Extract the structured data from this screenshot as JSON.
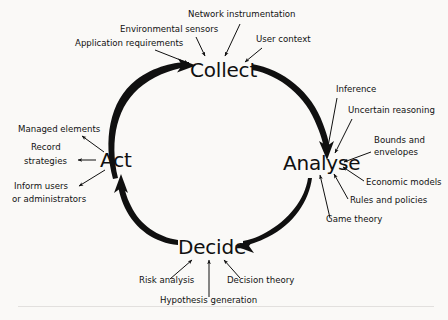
{
  "diagram": {
    "type": "cycle-diagram",
    "background_color": "#faf9f7",
    "ink_color": "#101010",
    "nodes": [
      {
        "id": "collect",
        "label": "Collect",
        "x": 220,
        "y": 70
      },
      {
        "id": "analyse",
        "label": "Analyse",
        "x": 318,
        "y": 163
      },
      {
        "id": "decide",
        "label": "Decide",
        "x": 209,
        "y": 247
      },
      {
        "id": "act",
        "label": "Act",
        "x": 119,
        "y": 160
      }
    ],
    "cycle_edges": [
      {
        "from": "act",
        "to": "collect"
      },
      {
        "from": "collect",
        "to": "analyse"
      },
      {
        "from": "analyse",
        "to": "decide"
      },
      {
        "from": "decide",
        "to": "act"
      }
    ],
    "annotations": {
      "collect_inputs": [
        {
          "label": "Application requirements",
          "x": 75,
          "y": 46,
          "anchor": "start"
        },
        {
          "label": "Environmental sensors",
          "x": 120,
          "y": 32,
          "anchor": "start"
        },
        {
          "label": "Network instrumentation",
          "x": 188,
          "y": 17,
          "anchor": "start"
        },
        {
          "label": "User context",
          "x": 256,
          "y": 42,
          "anchor": "start"
        }
      ],
      "analyse_inputs": [
        {
          "label": "Inference",
          "x": 336,
          "y": 92,
          "anchor": "start"
        },
        {
          "label": "Uncertain reasoning",
          "x": 348,
          "y": 113,
          "anchor": "start"
        },
        {
          "label": "Bounds and",
          "x": 374,
          "y": 143,
          "anchor": "start"
        },
        {
          "label": "envelopes",
          "x": 374,
          "y": 155,
          "anchor": "start"
        },
        {
          "label": "Economic models",
          "x": 366,
          "y": 185,
          "anchor": "start"
        },
        {
          "label": "Rules and policies",
          "x": 350,
          "y": 203,
          "anchor": "start"
        },
        {
          "label": "Game theory",
          "x": 326,
          "y": 222,
          "anchor": "start"
        }
      ],
      "decide_inputs": [
        {
          "label": "Risk analysis",
          "x": 139,
          "y": 283,
          "anchor": "start"
        },
        {
          "label": "Hypothesis generation",
          "x": 160,
          "y": 303,
          "anchor": "start"
        },
        {
          "label": "Decision theory",
          "x": 227,
          "y": 283,
          "anchor": "start"
        }
      ],
      "act_outputs": [
        {
          "label": "Managed elements",
          "x": 18,
          "y": 132,
          "anchor": "start"
        },
        {
          "label": "Record",
          "x": 31,
          "y": 150,
          "anchor": "start"
        },
        {
          "label": "strategies",
          "x": 24,
          "y": 164,
          "anchor": "start"
        },
        {
          "label": "Inform users",
          "x": 14,
          "y": 189,
          "anchor": "start"
        },
        {
          "label": "or administrators",
          "x": 12,
          "y": 202,
          "anchor": "start"
        }
      ]
    }
  }
}
